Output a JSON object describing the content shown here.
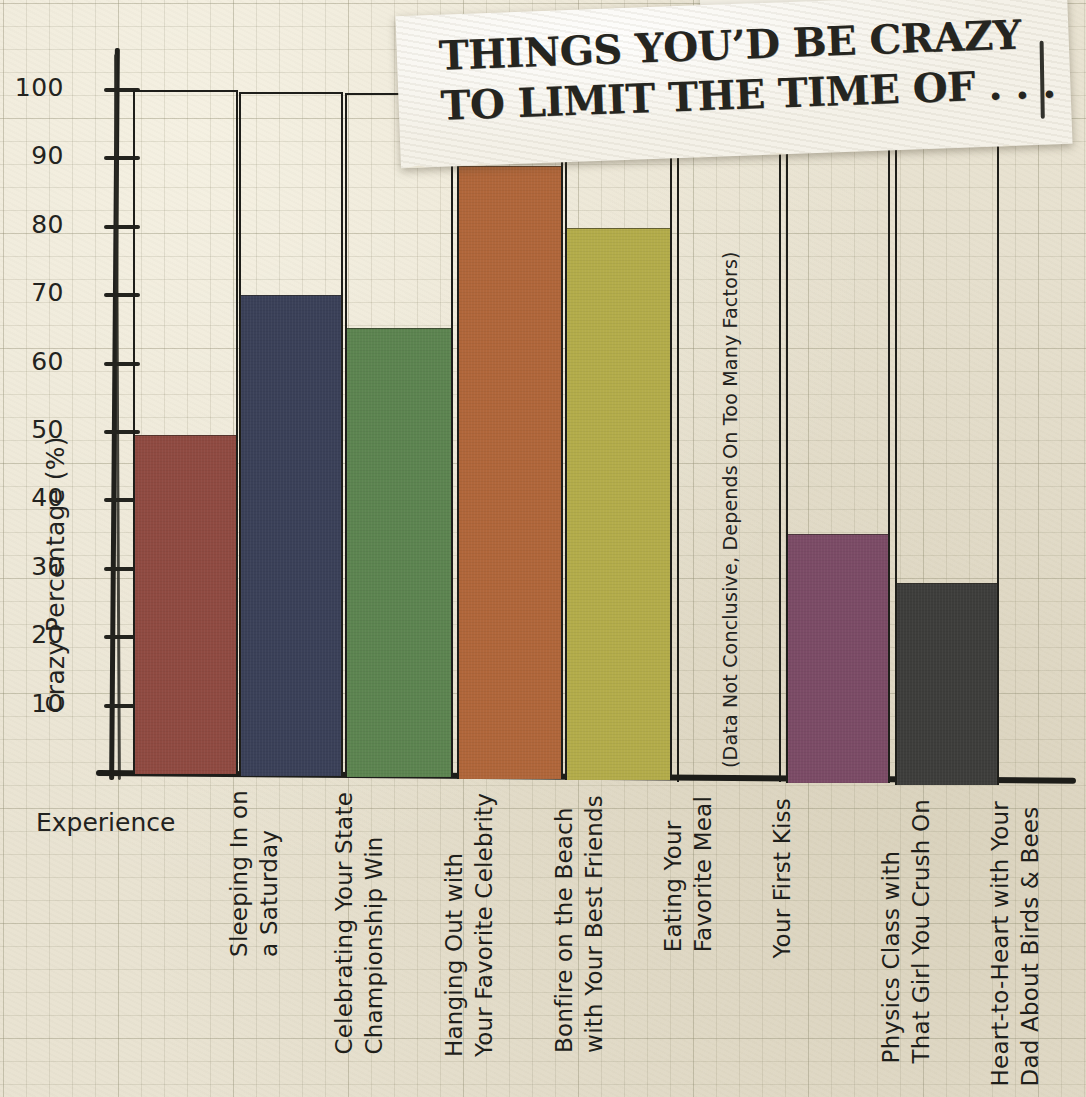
{
  "title": {
    "line1": "THINGS YOU’D BE CRAZY",
    "line2": "TO LIMIT THE TIME OF . . ."
  },
  "axes": {
    "ylabel": "Crazy Percentage (%)",
    "xlabel": "Experience",
    "yticks": [
      "10",
      "20",
      "30",
      "40",
      "50",
      "60",
      "70",
      "80",
      "90",
      "100"
    ]
  },
  "annotations": {
    "no_data": "(Data Not Conclusive, Depends On Too Many Factors)"
  },
  "colors": {
    "paper": "#e9e3d2",
    "ink": "#1f1f1b",
    "bar_red": "#8f4a41",
    "bar_navy": "#3a4058",
    "bar_green": "#5c8450",
    "bar_orange": "#b0663a",
    "bar_olive": "#b3ac4a",
    "bar_purple": "#7b4b66",
    "bar_charcoal": "#3d3d3b"
  },
  "chart_data": {
    "type": "bar",
    "title": "THINGS YOU’D BE CRAZY TO LIMIT THE TIME OF . . .",
    "xlabel": "Experience",
    "ylabel": "Crazy Percentage (%)",
    "ylim": [
      0,
      100
    ],
    "grid": true,
    "legend": "none",
    "categories": [
      "Sleeping In on a Saturday",
      "Celebrating Your State Championship Win",
      "Hanging Out with Your Favorite Celebrity",
      "Bonfire on the Beach with Your Best Friends",
      "Eating Your Favorite Meal",
      "Your First Kiss",
      "Physics Class with That Girl You Crush On",
      "Heart-to-Heart with Your Dad About Birds & Bees"
    ],
    "values": [
      49.5,
      70.3,
      65.6,
      89.5,
      80.7,
      null,
      36.5,
      29.5
    ],
    "bars": [
      {
        "label_lines": [
          "Sleeping In on",
          "a Saturday"
        ],
        "value": 49.5,
        "color": "#8f4a41",
        "note": null
      },
      {
        "label_lines": [
          "Celebrating Your State",
          "Championship Win"
        ],
        "value": 70.3,
        "color": "#3a4058",
        "note": null
      },
      {
        "label_lines": [
          "Hanging Out with",
          "Your Favorite Celebrity"
        ],
        "value": 65.6,
        "color": "#5c8450",
        "note": null
      },
      {
        "label_lines": [
          "Bonfire on the Beach",
          "with Your Best Friends"
        ],
        "value": 89.5,
        "color": "#b0663a",
        "note": null
      },
      {
        "label_lines": [
          "Eating Your",
          "Favorite Meal"
        ],
        "value": 80.7,
        "color": "#b3ac4a",
        "note": null
      },
      {
        "label_lines": [
          "Your First Kiss"
        ],
        "value": null,
        "color": null,
        "note": "(Data Not Conclusive, Depends On Too Many Factors)"
      },
      {
        "label_lines": [
          "Physics Class with",
          "That Girl You Crush On"
        ],
        "value": 36.5,
        "color": "#7b4b66",
        "note": null
      },
      {
        "label_lines": [
          "Heart-to-Heart with Your",
          "Dad About Birds & Bees"
        ],
        "value": 29.5,
        "color": "#3d3d3b",
        "note": null
      }
    ]
  }
}
